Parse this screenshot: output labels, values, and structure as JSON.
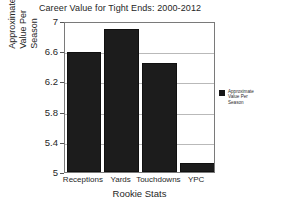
{
  "chart_data": {
    "type": "bar",
    "title": "Career Value for Tight Ends: 2000-2012",
    "xlabel": "Rookie Stats",
    "ylabel_lines": [
      "Approximate",
      "Value Per",
      "Season"
    ],
    "ylabel": "Approximate Value Per Season",
    "categories": [
      "Receptions",
      "Yards",
      "Touchdowns",
      "YPC"
    ],
    "values": [
      6.59,
      6.89,
      6.45,
      5.12
    ],
    "series": [
      {
        "name": "Approximate Value Per Season",
        "values": [
          6.59,
          6.89,
          6.45,
          5.12
        ]
      }
    ],
    "ylim": [
      5,
      7
    ],
    "yticks": [
      5,
      5.4,
      5.8,
      6.2,
      6.6,
      7
    ],
    "ytick_labels": [
      "5",
      "5.4",
      "5.8",
      "6.2",
      "6.6",
      "7"
    ],
    "grid": true,
    "grid_axis": "y",
    "legend_position": "right",
    "legend_entries": [
      {
        "label": "Approximate Value Per Season",
        "label_lines": [
          "Approximate",
          "Value Per",
          "Season"
        ],
        "color": "#161616"
      }
    ],
    "bar_color": "#1c1c1c",
    "background_color": "#ffffff",
    "axis_color": "#7a7a7a",
    "gridline_color": "#b9b9b9"
  }
}
